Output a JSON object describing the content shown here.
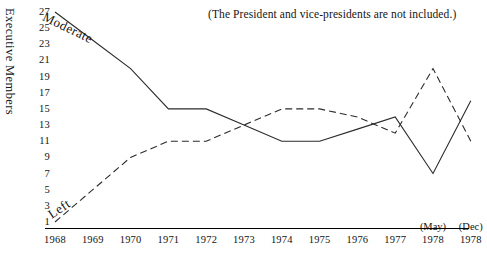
{
  "note": "(The President and vice-presidents are not included.)",
  "axis": {
    "ylabel": "Executive Members",
    "yticks": [
      "27",
      "25",
      "23",
      "21",
      "19",
      "17",
      "15",
      "13",
      "11",
      "9",
      "7",
      "5",
      "3",
      "1"
    ],
    "xticks": [
      "1968",
      "1969",
      "1970",
      "1971",
      "1972",
      "1973",
      "1974",
      "1975",
      "1976",
      "1977",
      "1978",
      "1978"
    ],
    "xsublabels": {
      "may": "(May)",
      "dec": "(Dec)"
    }
  },
  "series_labels": {
    "moderate": "Moderate",
    "left": "Left"
  },
  "chart_data": {
    "type": "line",
    "title": "",
    "subtitle": "",
    "annotations": [
      "(The President and vice-presidents are not included.)"
    ],
    "xlabel": "",
    "ylabel": "Executive Members",
    "x": [
      "1968",
      "1969",
      "1970",
      "1971",
      "1972",
      "1973",
      "1974",
      "1975",
      "1976",
      "1977",
      "1978 (May)",
      "1978 (Dec)"
    ],
    "categories": [
      "1968",
      "1969",
      "1970",
      "1971",
      "1972",
      "1973",
      "1974",
      "1975",
      "1976",
      "1977",
      "1978 (May)",
      "1978 (Dec)"
    ],
    "ylim": [
      0,
      28
    ],
    "xlim": [
      0,
      11
    ],
    "grid": false,
    "legend": "inline-labels",
    "series": [
      {
        "name": "Moderate",
        "style": "solid",
        "color": "#2b2b2b",
        "values": [
          27,
          23.5,
          20,
          15,
          15,
          13,
          11,
          11,
          12.5,
          14,
          7,
          16
        ]
      },
      {
        "name": "Left",
        "style": "dashed",
        "color": "#2b2b2b",
        "values": [
          1,
          5,
          9,
          11,
          11,
          13,
          15,
          15,
          14,
          12,
          20,
          11
        ]
      }
    ]
  }
}
